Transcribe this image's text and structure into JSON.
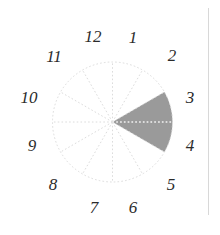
{
  "figure": {
    "canvas": {
      "width": 220,
      "height": 235,
      "background": "#ffffff"
    }
  },
  "chart_data": {
    "type": "pie",
    "title": "",
    "subtitle": "",
    "xlabel": "",
    "ylabel": "",
    "grid": true,
    "legend": null,
    "center": {
      "x": 112.5,
      "y": 122
    },
    "radius": 60,
    "sector_count": 12,
    "sector_degrees": 30,
    "categories": [
      "1",
      "2",
      "3",
      "4",
      "5",
      "6",
      "7",
      "8",
      "9",
      "10",
      "11",
      "12"
    ],
    "values": [
      0,
      1,
      1,
      0,
      0,
      0,
      0,
      0,
      0,
      0,
      0,
      0
    ],
    "highlighted_sectors": [
      "2",
      "3",
      "4"
    ],
    "highlight_start_deg": 60,
    "highlight_end_deg": 120,
    "colors": {
      "highlight_fill": "#9a9a9a",
      "circle_outline": "#dcdcdc",
      "spoke": "#dcdcdc",
      "spoke_over_highlight": "#f2f2f2",
      "label_text": "#2b2b2b",
      "rule": "#d8d8d8"
    },
    "tick_labels": [
      {
        "text": "12",
        "hour": 12,
        "angle_deg": 0,
        "x": 93,
        "y": 36
      },
      {
        "text": "1",
        "hour": 1,
        "angle_deg": 30,
        "x": 133,
        "y": 37
      },
      {
        "text": "2",
        "hour": 2,
        "angle_deg": 60,
        "x": 172,
        "y": 55
      },
      {
        "text": "3",
        "hour": 3,
        "angle_deg": 90,
        "x": 190,
        "y": 97
      },
      {
        "text": "4",
        "hour": 4,
        "angle_deg": 120,
        "x": 190,
        "y": 145
      },
      {
        "text": "5",
        "hour": 5,
        "angle_deg": 150,
        "x": 171,
        "y": 184
      },
      {
        "text": "6",
        "hour": 6,
        "angle_deg": 180,
        "x": 133,
        "y": 207
      },
      {
        "text": "7",
        "hour": 7,
        "angle_deg": 210,
        "x": 94,
        "y": 207
      },
      {
        "text": "8",
        "hour": 8,
        "angle_deg": 240,
        "x": 53,
        "y": 184
      },
      {
        "text": "9",
        "hour": 9,
        "angle_deg": 270,
        "x": 32,
        "y": 145
      },
      {
        "text": "10",
        "hour": 10,
        "angle_deg": 300,
        "x": 29,
        "y": 97
      },
      {
        "text": "11",
        "hour": 11,
        "angle_deg": 330,
        "x": 54,
        "y": 56
      }
    ]
  },
  "decorations": {
    "right_rule": {
      "x": 208,
      "y": 8,
      "width": 1,
      "height": 207
    }
  }
}
